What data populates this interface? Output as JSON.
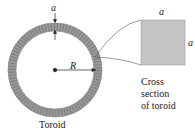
{
  "diagram": {
    "title": "Toroid",
    "labels": {
      "thickness_top": "a",
      "radius": "R",
      "toroid_caption": "Toroid",
      "cross_section_width": "a",
      "cross_section_height": "a",
      "cross_section_caption_line1": "Cross",
      "cross_section_caption_line2": "section",
      "cross_section_caption_line3": "of toroid"
    },
    "colors": {
      "ring_fill": "#9a9a9a",
      "ring_winding": "#7d7d7d",
      "cross_section_fill": "#c4c4c4",
      "line": "#333333"
    }
  }
}
